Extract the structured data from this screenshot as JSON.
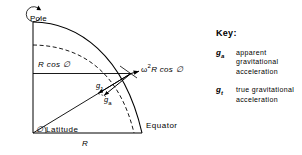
{
  "diagram": {
    "labels": {
      "pole": "Pole",
      "r_cos_phi": "R cos ∅",
      "omega_term_prefix": "ω",
      "omega_term_exponent": "2",
      "omega_term_rest": "R cos ∅",
      "g_true_symbol": "g",
      "g_true_subscript": "1",
      "g_apparent_symbol": "g",
      "g_apparent_subscript": "a",
      "latitude": "Latitude",
      "latitude_symbol": "∅",
      "equator": "Equator",
      "radius": "R"
    },
    "colors": {
      "line": "#000000",
      "background": "#ffffff"
    }
  },
  "key": {
    "title": "Key:",
    "entries": [
      {
        "symbol": "g",
        "subscript": "a",
        "description": "apparent gravitational acceleration"
      },
      {
        "symbol": "g",
        "subscript": "t",
        "description": "true gravitational acceleration"
      }
    ]
  }
}
